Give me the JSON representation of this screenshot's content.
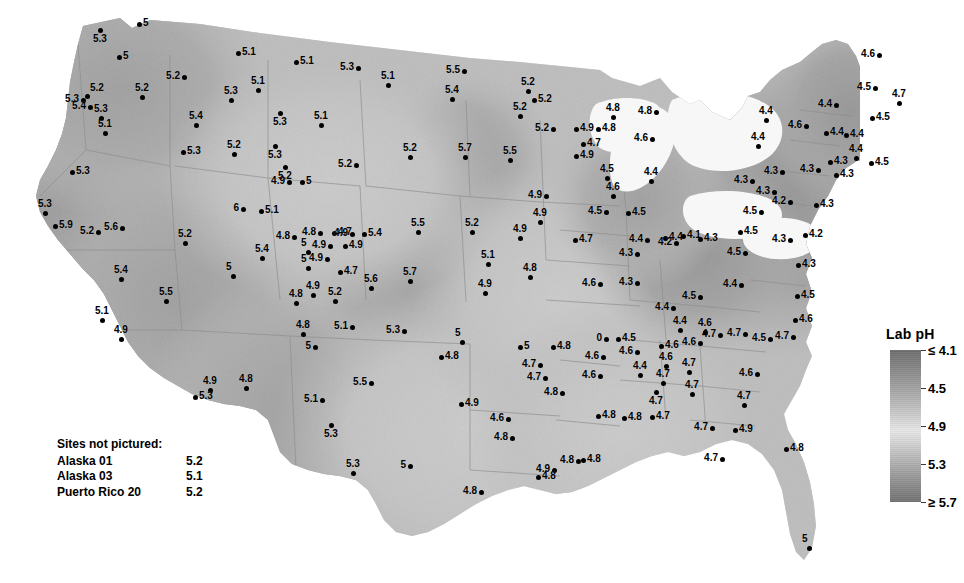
{
  "legend": {
    "title": "Lab pH",
    "ticks": [
      {
        "label": "≤ 4.1",
        "pos": 0
      },
      {
        "label": "4.5",
        "pos": 25
      },
      {
        "label": "4.9",
        "pos": 50
      },
      {
        "label": "5.3",
        "pos": 75
      },
      {
        "label": "≥ 5.7",
        "pos": 100
      }
    ]
  },
  "not_pictured": {
    "heading": "Sites not pictured:",
    "rows": [
      {
        "name": "Alaska 01",
        "value": "5.2"
      },
      {
        "name": "Alaska 03",
        "value": "5.1"
      },
      {
        "name": "Puerto Rico 20",
        "value": "5.2"
      }
    ]
  },
  "chart_data": {
    "type": "map",
    "title": "Lab pH",
    "variable": "Lab pH",
    "region": "Contiguous United States",
    "colorbar": {
      "label": "Lab pH",
      "min_label": "≤ 4.1",
      "max_label": "≥ 5.7",
      "tick_labels": [
        "≤ 4.1",
        "4.5",
        "4.9",
        "5.3",
        "≥ 5.7"
      ],
      "tick_values": [
        4.1,
        4.5,
        4.9,
        5.3,
        5.7
      ],
      "scale": "diverging-grayscale: dark at low pH, light near 4.9, dark at high pH"
    },
    "value_range": [
      4.1,
      5.9
    ],
    "sites_not_pictured": [
      {
        "name": "Alaska 01",
        "value": 5.2
      },
      {
        "name": "Alaska 03",
        "value": 5.1
      },
      {
        "name": "Puerto Rico 20",
        "value": 5.2
      }
    ],
    "points": [
      {
        "x": 100,
        "y": 30,
        "v": "5.3",
        "lp": "lp-b"
      },
      {
        "x": 139,
        "y": 24,
        "v": "5",
        "lp": "lp-r"
      },
      {
        "x": 119,
        "y": 57,
        "v": "5",
        "lp": "lp-r"
      },
      {
        "x": 238,
        "y": 53,
        "v": "5.1",
        "lp": "lp-r"
      },
      {
        "x": 296,
        "y": 62,
        "v": "5.1",
        "lp": "lp-r"
      },
      {
        "x": 358,
        "y": 68,
        "v": "5.3",
        "lp": "lp-l"
      },
      {
        "x": 464,
        "y": 71,
        "v": "5.5",
        "lp": "lp-l"
      },
      {
        "x": 184,
        "y": 77,
        "v": "5.2",
        "lp": "lp-l"
      },
      {
        "x": 388,
        "y": 85,
        "v": "5.1",
        "lp": "lp-t"
      },
      {
        "x": 87,
        "y": 96,
        "v": "5.2",
        "lp": "lp-tr"
      },
      {
        "x": 83,
        "y": 100,
        "v": "5.3",
        "lp": "lp-l"
      },
      {
        "x": 90,
        "y": 107,
        "v": "5.4",
        "lp": "lp-l"
      },
      {
        "x": 142,
        "y": 97,
        "v": "5.2",
        "lp": "lp-t"
      },
      {
        "x": 231,
        "y": 100,
        "v": "5.3",
        "lp": "lp-t"
      },
      {
        "x": 258,
        "y": 90,
        "v": "5.1",
        "lp": "lp-t"
      },
      {
        "x": 452,
        "y": 99,
        "v": "5.4",
        "lp": "lp-t"
      },
      {
        "x": 528,
        "y": 91,
        "v": "5.2",
        "lp": "lp-t"
      },
      {
        "x": 534,
        "y": 100,
        "v": "5.2",
        "lp": "lp-r"
      },
      {
        "x": 101,
        "y": 118,
        "v": "5.3",
        "lp": "lp-t"
      },
      {
        "x": 105,
        "y": 133,
        "v": "5.1",
        "lp": "lp-t"
      },
      {
        "x": 196,
        "y": 125,
        "v": "5.4",
        "lp": "lp-t"
      },
      {
        "x": 321,
        "y": 125,
        "v": "5.1",
        "lp": "lp-t"
      },
      {
        "x": 280,
        "y": 113,
        "v": "5.3",
        "lp": "lp-b"
      },
      {
        "x": 520,
        "y": 116,
        "v": "5.2",
        "lp": "lp-t"
      },
      {
        "x": 553,
        "y": 129,
        "v": "5.2",
        "lp": "lp-l"
      },
      {
        "x": 576,
        "y": 129,
        "v": "4.9",
        "lp": "lp-r"
      },
      {
        "x": 598,
        "y": 129,
        "v": "4.8",
        "lp": "lp-r"
      },
      {
        "x": 613,
        "y": 117,
        "v": "4.8",
        "lp": "lp-t"
      },
      {
        "x": 652,
        "y": 139,
        "v": "4.6",
        "lp": "lp-l"
      },
      {
        "x": 656,
        "y": 112,
        "v": "4.8",
        "lp": "lp-l"
      },
      {
        "x": 583,
        "y": 144,
        "v": "4.7",
        "lp": "lp-r"
      },
      {
        "x": 576,
        "y": 156,
        "v": "4.9",
        "lp": "lp-r"
      },
      {
        "x": 183,
        "y": 152,
        "v": "5.3",
        "lp": "lp-r"
      },
      {
        "x": 234,
        "y": 154,
        "v": "5.2",
        "lp": "lp-t"
      },
      {
        "x": 275,
        "y": 146,
        "v": "5.3",
        "lp": "lp-b"
      },
      {
        "x": 356,
        "y": 165,
        "v": "5.2",
        "lp": "lp-l"
      },
      {
        "x": 410,
        "y": 157,
        "v": "5.2",
        "lp": "lp-t"
      },
      {
        "x": 510,
        "y": 160,
        "v": "5.5",
        "lp": "lp-t"
      },
      {
        "x": 465,
        "y": 157,
        "v": "5.7",
        "lp": "lp-t"
      },
      {
        "x": 285,
        "y": 167,
        "v": "5.2",
        "lp": "lp-b"
      },
      {
        "x": 289,
        "y": 182,
        "v": "4.9",
        "lp": "lp-l"
      },
      {
        "x": 302,
        "y": 182,
        "v": "5",
        "lp": "lp-r"
      },
      {
        "x": 72,
        "y": 172,
        "v": "5.3",
        "lp": "lp-r"
      },
      {
        "x": 607,
        "y": 178,
        "v": "4.5",
        "lp": "lp-t"
      },
      {
        "x": 613,
        "y": 196,
        "v": "4.6",
        "lp": "lp-t"
      },
      {
        "x": 606,
        "y": 212,
        "v": "4.5",
        "lp": "lp-l"
      },
      {
        "x": 628,
        "y": 213,
        "v": "4.5",
        "lp": "lp-r"
      },
      {
        "x": 651,
        "y": 181,
        "v": "4.4",
        "lp": "lp-t"
      },
      {
        "x": 647,
        "y": 240,
        "v": "4.4",
        "lp": "lp-l"
      },
      {
        "x": 665,
        "y": 238,
        "v": "4.4",
        "lp": "lp-r"
      },
      {
        "x": 546,
        "y": 196,
        "v": "4.9",
        "lp": "lp-l"
      },
      {
        "x": 540,
        "y": 222,
        "v": "4.9",
        "lp": "lp-t"
      },
      {
        "x": 575,
        "y": 240,
        "v": "4.7",
        "lp": "lp-r"
      },
      {
        "x": 45,
        "y": 213,
        "v": "5.3",
        "lp": "lp-t"
      },
      {
        "x": 55,
        "y": 226,
        "v": "5.9",
        "lp": "lp-r"
      },
      {
        "x": 98,
        "y": 232,
        "v": "5.2",
        "lp": "lp-l"
      },
      {
        "x": 122,
        "y": 228,
        "v": "5.6",
        "lp": "lp-l"
      },
      {
        "x": 185,
        "y": 243,
        "v": "5.2",
        "lp": "lp-t"
      },
      {
        "x": 121,
        "y": 279,
        "v": "5.4",
        "lp": "lp-t"
      },
      {
        "x": 166,
        "y": 301,
        "v": "5.5",
        "lp": "lp-t"
      },
      {
        "x": 102,
        "y": 320,
        "v": "5.1",
        "lp": "lp-t"
      },
      {
        "x": 121,
        "y": 339,
        "v": "4.9",
        "lp": "lp-t"
      },
      {
        "x": 243,
        "y": 209,
        "v": "6",
        "lp": "lp-l"
      },
      {
        "x": 261,
        "y": 211,
        "v": "5.1",
        "lp": "lp-r"
      },
      {
        "x": 294,
        "y": 237,
        "v": "4.8",
        "lp": "lp-l"
      },
      {
        "x": 320,
        "y": 233,
        "v": "4.8",
        "lp": "lp-l"
      },
      {
        "x": 334,
        "y": 233,
        "v": "4.7",
        "lp": "lp-r"
      },
      {
        "x": 352,
        "y": 234,
        "v": "4.9",
        "lp": "lp-l"
      },
      {
        "x": 364,
        "y": 234,
        "v": "5.4",
        "lp": "lp-r"
      },
      {
        "x": 330,
        "y": 246,
        "v": "4.9",
        "lp": "lp-l"
      },
      {
        "x": 345,
        "y": 246,
        "v": "4.9",
        "lp": "lp-r"
      },
      {
        "x": 308,
        "y": 252,
        "v": "5",
        "lp": "lp-t"
      },
      {
        "x": 327,
        "y": 259,
        "v": "4.9",
        "lp": "lp-l"
      },
      {
        "x": 308,
        "y": 268,
        "v": "5",
        "lp": "lp-t"
      },
      {
        "x": 340,
        "y": 272,
        "v": "4.7",
        "lp": "lp-r"
      },
      {
        "x": 418,
        "y": 232,
        "v": "5.5",
        "lp": "lp-t"
      },
      {
        "x": 472,
        "y": 232,
        "v": "5.2",
        "lp": "lp-t"
      },
      {
        "x": 520,
        "y": 238,
        "v": "4.9",
        "lp": "lp-t"
      },
      {
        "x": 410,
        "y": 281,
        "v": "5.7",
        "lp": "lp-t"
      },
      {
        "x": 371,
        "y": 288,
        "v": "5.6",
        "lp": "lp-t"
      },
      {
        "x": 262,
        "y": 258,
        "v": "5.4",
        "lp": "lp-t"
      },
      {
        "x": 233,
        "y": 276,
        "v": "5",
        "lp": "lp-t"
      },
      {
        "x": 296,
        "y": 303,
        "v": "4.8",
        "lp": "lp-t"
      },
      {
        "x": 313,
        "y": 295,
        "v": "4.9",
        "lp": "lp-t"
      },
      {
        "x": 335,
        "y": 301,
        "v": "5.2",
        "lp": "lp-t"
      },
      {
        "x": 303,
        "y": 334,
        "v": "4.8",
        "lp": "lp-t"
      },
      {
        "x": 315,
        "y": 347,
        "v": "5",
        "lp": "lp-l"
      },
      {
        "x": 352,
        "y": 327,
        "v": "5.1",
        "lp": "lp-l"
      },
      {
        "x": 404,
        "y": 331,
        "v": "5.3",
        "lp": "lp-l"
      },
      {
        "x": 462,
        "y": 342,
        "v": "5",
        "lp": "lp-t"
      },
      {
        "x": 520,
        "y": 347,
        "v": "5",
        "lp": "lp-r"
      },
      {
        "x": 553,
        "y": 347,
        "v": "4.8",
        "lp": "lp-r"
      },
      {
        "x": 485,
        "y": 293,
        "v": "4.9",
        "lp": "lp-t"
      },
      {
        "x": 488,
        "y": 264,
        "v": "5.1",
        "lp": "lp-t"
      },
      {
        "x": 530,
        "y": 277,
        "v": "4.8",
        "lp": "lp-t"
      },
      {
        "x": 600,
        "y": 284,
        "v": "4.6",
        "lp": "lp-l"
      },
      {
        "x": 637,
        "y": 283,
        "v": "4.3",
        "lp": "lp-l"
      },
      {
        "x": 637,
        "y": 254,
        "v": "4.3",
        "lp": "lp-l"
      },
      {
        "x": 676,
        "y": 243,
        "v": "4.2",
        "lp": "lp-l"
      },
      {
        "x": 683,
        "y": 236,
        "v": "4.1",
        "lp": "lp-r"
      },
      {
        "x": 700,
        "y": 239,
        "v": "4.3",
        "lp": "lp-r"
      },
      {
        "x": 740,
        "y": 232,
        "v": "4.5",
        "lp": "lp-r"
      },
      {
        "x": 745,
        "y": 253,
        "v": "4.5",
        "lp": "lp-l"
      },
      {
        "x": 741,
        "y": 285,
        "v": "4.4",
        "lp": "lp-l"
      },
      {
        "x": 700,
        "y": 297,
        "v": "4.5",
        "lp": "lp-l"
      },
      {
        "x": 673,
        "y": 308,
        "v": "4.4",
        "lp": "lp-l"
      },
      {
        "x": 680,
        "y": 330,
        "v": "4.4",
        "lp": "lp-t"
      },
      {
        "x": 720,
        "y": 335,
        "v": "4.7",
        "lp": "lp-l"
      },
      {
        "x": 745,
        "y": 334,
        "v": "4.7",
        "lp": "lp-l"
      },
      {
        "x": 770,
        "y": 339,
        "v": "4.5",
        "lp": "lp-l"
      },
      {
        "x": 793,
        "y": 337,
        "v": "4.7",
        "lp": "lp-l"
      },
      {
        "x": 795,
        "y": 320,
        "v": "4.6",
        "lp": "lp-r"
      },
      {
        "x": 797,
        "y": 296,
        "v": "4.5",
        "lp": "lp-r"
      },
      {
        "x": 798,
        "y": 265,
        "v": "4.3",
        "lp": "lp-r"
      },
      {
        "x": 790,
        "y": 240,
        "v": "4.3",
        "lp": "lp-l"
      },
      {
        "x": 805,
        "y": 235,
        "v": "4.2",
        "lp": "lp-r"
      },
      {
        "x": 816,
        "y": 205,
        "v": "4.3",
        "lp": "lp-r"
      },
      {
        "x": 790,
        "y": 202,
        "v": "4.2",
        "lp": "lp-l"
      },
      {
        "x": 782,
        "y": 172,
        "v": "4.3",
        "lp": "lp-l"
      },
      {
        "x": 818,
        "y": 170,
        "v": "4.3",
        "lp": "lp-l"
      },
      {
        "x": 830,
        "y": 162,
        "v": "4.3",
        "lp": "lp-r"
      },
      {
        "x": 836,
        "y": 175,
        "v": "4.3",
        "lp": "lp-r"
      },
      {
        "x": 856,
        "y": 158,
        "v": "4.4",
        "lp": "lp-t"
      },
      {
        "x": 871,
        "y": 163,
        "v": "4.5",
        "lp": "lp-r"
      },
      {
        "x": 806,
        "y": 126,
        "v": "4.6",
        "lp": "lp-l"
      },
      {
        "x": 826,
        "y": 133,
        "v": "4.4",
        "lp": "lp-r"
      },
      {
        "x": 846,
        "y": 135,
        "v": "4.4",
        "lp": "lp-r"
      },
      {
        "x": 836,
        "y": 105,
        "v": "4.4",
        "lp": "lp-l"
      },
      {
        "x": 872,
        "y": 118,
        "v": "4.5",
        "lp": "lp-r"
      },
      {
        "x": 879,
        "y": 55,
        "v": "4.6",
        "lp": "lp-l"
      },
      {
        "x": 875,
        "y": 88,
        "v": "4.5",
        "lp": "lp-l"
      },
      {
        "x": 899,
        "y": 103,
        "v": "4.7",
        "lp": "lp-t"
      },
      {
        "x": 758,
        "y": 146,
        "v": "4.4",
        "lp": "lp-t"
      },
      {
        "x": 766,
        "y": 120,
        "v": "4.4",
        "lp": "lp-t"
      },
      {
        "x": 774,
        "y": 192,
        "v": "4.3",
        "lp": "lp-l"
      },
      {
        "x": 761,
        "y": 212,
        "v": "4.5",
        "lp": "lp-l"
      },
      {
        "x": 752,
        "y": 181,
        "v": "4.3",
        "lp": "lp-l"
      },
      {
        "x": 618,
        "y": 339,
        "v": "4.5",
        "lp": "lp-r"
      },
      {
        "x": 606,
        "y": 339,
        "v": "0",
        "lp": "lp-l"
      },
      {
        "x": 603,
        "y": 357,
        "v": "4.6",
        "lp": "lp-l"
      },
      {
        "x": 637,
        "y": 352,
        "v": "4.6",
        "lp": "lp-l"
      },
      {
        "x": 661,
        "y": 346,
        "v": "4.6",
        "lp": "lp-r"
      },
      {
        "x": 689,
        "y": 372,
        "v": "4.7",
        "lp": "lp-t"
      },
      {
        "x": 600,
        "y": 376,
        "v": "4.6",
        "lp": "lp-l"
      },
      {
        "x": 640,
        "y": 375,
        "v": "4.4",
        "lp": "lp-t"
      },
      {
        "x": 700,
        "y": 343,
        "v": "4.6",
        "lp": "lp-l"
      },
      {
        "x": 705,
        "y": 332,
        "v": "4.6",
        "lp": "lp-t"
      },
      {
        "x": 666,
        "y": 366,
        "v": "4.6",
        "lp": "lp-t"
      },
      {
        "x": 663,
        "y": 383,
        "v": "4.7",
        "lp": "lp-t"
      },
      {
        "x": 656,
        "y": 392,
        "v": "4.7",
        "lp": "lp-b"
      },
      {
        "x": 692,
        "y": 394,
        "v": "4.7",
        "lp": "lp-t"
      },
      {
        "x": 757,
        "y": 374,
        "v": "4.6",
        "lp": "lp-l"
      },
      {
        "x": 744,
        "y": 405,
        "v": "4.7",
        "lp": "lp-t"
      },
      {
        "x": 712,
        "y": 428,
        "v": "4.7",
        "lp": "lp-l"
      },
      {
        "x": 735,
        "y": 430,
        "v": "4.9",
        "lp": "lp-r"
      },
      {
        "x": 722,
        "y": 459,
        "v": "4.7",
        "lp": "lp-l"
      },
      {
        "x": 786,
        "y": 449,
        "v": "4.8",
        "lp": "lp-r"
      },
      {
        "x": 809,
        "y": 548,
        "v": "5",
        "lp": "lp-t"
      },
      {
        "x": 540,
        "y": 365,
        "v": "4.7",
        "lp": "lp-l"
      },
      {
        "x": 545,
        "y": 378,
        "v": "4.7",
        "lp": "lp-l"
      },
      {
        "x": 562,
        "y": 393,
        "v": "4.8",
        "lp": "lp-l"
      },
      {
        "x": 598,
        "y": 416,
        "v": "4.8",
        "lp": "lp-r"
      },
      {
        "x": 624,
        "y": 418,
        "v": "4.8",
        "lp": "lp-r"
      },
      {
        "x": 652,
        "y": 417,
        "v": "4.7",
        "lp": "lp-r"
      },
      {
        "x": 508,
        "y": 419,
        "v": "4.6",
        "lp": "lp-l"
      },
      {
        "x": 512,
        "y": 438,
        "v": "4.8",
        "lp": "lp-l"
      },
      {
        "x": 461,
        "y": 404,
        "v": "4.9",
        "lp": "lp-r"
      },
      {
        "x": 554,
        "y": 470,
        "v": "4.9",
        "lp": "lp-l"
      },
      {
        "x": 578,
        "y": 461,
        "v": "4.8",
        "lp": "lp-l"
      },
      {
        "x": 481,
        "y": 492,
        "v": "4.8",
        "lp": "lp-l"
      },
      {
        "x": 538,
        "y": 477,
        "v": "4.8",
        "lp": "lp-r"
      },
      {
        "x": 583,
        "y": 460,
        "v": "4.8",
        "lp": "lp-r"
      },
      {
        "x": 210,
        "y": 390,
        "v": "4.9",
        "lp": "lp-t"
      },
      {
        "x": 246,
        "y": 388,
        "v": "4.8",
        "lp": "lp-t"
      },
      {
        "x": 322,
        "y": 400,
        "v": "5.1",
        "lp": "lp-l"
      },
      {
        "x": 331,
        "y": 425,
        "v": "5.3",
        "lp": "lp-b"
      },
      {
        "x": 195,
        "y": 397,
        "v": "5.3",
        "lp": "lp-r"
      },
      {
        "x": 371,
        "y": 383,
        "v": "5.5",
        "lp": "lp-l"
      },
      {
        "x": 353,
        "y": 473,
        "v": "5.3",
        "lp": "lp-t"
      },
      {
        "x": 410,
        "y": 466,
        "v": "5",
        "lp": "lp-l"
      },
      {
        "x": 441,
        "y": 357,
        "v": "4.8",
        "lp": "lp-r"
      }
    ]
  }
}
